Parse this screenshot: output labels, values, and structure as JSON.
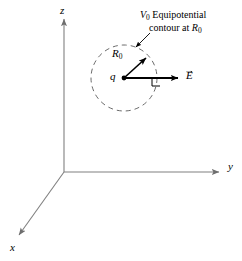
{
  "figure": {
    "background_color": "#ffffff",
    "ink_color": "#000000",
    "axis_color": "#808080",
    "width": 242,
    "height": 261
  },
  "axes": {
    "origin": {
      "x": 64,
      "y": 172
    },
    "z": {
      "label": "z",
      "tip_x": 64,
      "tip_y": 16
    },
    "y": {
      "label": "y",
      "tip_x": 222,
      "tip_y": 172
    },
    "x": {
      "label": "x",
      "tip_x": 16,
      "tip_y": 238
    }
  },
  "contour": {
    "center": {
      "x": 124,
      "y": 78
    },
    "radius": 33,
    "style": "dashed",
    "stroke_color": "#6b6b6b"
  },
  "charge": {
    "label": "q",
    "marker": "filled-dot",
    "x": 124,
    "y": 78
  },
  "radius_vector": {
    "label_base": "R",
    "label_sub": "0",
    "tip": {
      "x": 149,
      "y": 55
    }
  },
  "field_vector": {
    "label_base": "E",
    "notation": "arrow-overbar",
    "tip": {
      "x": 182,
      "y": 78
    },
    "right_angle_marker": true
  },
  "caption": {
    "line1_symbol": "V",
    "line1_sub": "0",
    "line1_text": "Equipotential",
    "line2_text": "contour at ",
    "line2_symbol": "R",
    "line2_sub": "0",
    "leader_from": {
      "x": 148,
      "y": 34
    },
    "leader_to": {
      "x": 134,
      "y": 48
    }
  }
}
